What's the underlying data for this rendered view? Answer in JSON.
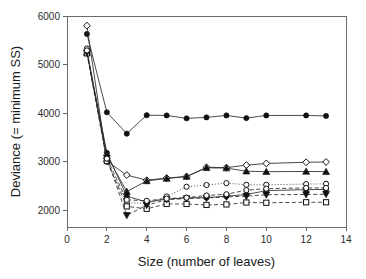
{
  "chart_data": {
    "type": "line",
    "title": "",
    "xlabel": "Size (number of leaves)",
    "ylabel": "Deviance (= minimum SS)",
    "xlim": [
      0,
      14
    ],
    "ylim": [
      1650,
      6000
    ],
    "xticks": [
      0,
      2,
      4,
      6,
      8,
      10,
      12,
      14
    ],
    "yticks": [
      2000,
      3000,
      4000,
      5000,
      6000
    ],
    "grid": false,
    "legend": "none",
    "series": [
      {
        "name": "series-1-filled-circle-upper",
        "marker": "filled-circle",
        "line": "solid",
        "x": [
          1,
          2,
          3,
          4,
          5,
          6,
          7,
          8,
          9,
          10,
          12,
          13
        ],
        "y": [
          5630,
          4015,
          3575,
          3955,
          3950,
          3890,
          3910,
          3950,
          3895,
          3950,
          3950,
          3940
        ]
      },
      {
        "name": "series-2-open-diamond",
        "marker": "open-diamond",
        "line": "solid",
        "x": [
          1,
          2,
          3,
          4,
          5,
          6,
          7,
          8,
          9,
          10,
          12,
          13
        ],
        "y": [
          5800,
          3005,
          2720,
          2615,
          2660,
          2690,
          2880,
          2875,
          2925,
          2960,
          2985,
          2990
        ]
      },
      {
        "name": "series-3-filled-triangle",
        "marker": "filled-triangle",
        "line": "solid",
        "x": [
          1,
          2,
          3,
          4,
          5,
          6,
          7,
          8,
          9,
          10,
          12,
          13
        ],
        "y": [
          5250,
          3120,
          2380,
          2600,
          2650,
          2690,
          2870,
          2865,
          2800,
          2790,
          2795,
          2790
        ]
      },
      {
        "name": "series-4-open-circle",
        "marker": "open-circle",
        "line": "dotted",
        "x": [
          1,
          2,
          3,
          4,
          5,
          6,
          7,
          8,
          9,
          10,
          12,
          13
        ],
        "y": [
          5330,
          3000,
          2150,
          2140,
          2280,
          2480,
          2515,
          2555,
          2520,
          2520,
          2535,
          2540
        ]
      },
      {
        "name": "series-5-filled-circle-lower",
        "marker": "filled-circle",
        "line": "solid",
        "x": [
          1,
          2,
          3,
          4,
          5,
          6,
          7,
          8,
          9,
          10,
          12,
          13
        ],
        "y": [
          5270,
          3180,
          2285,
          2165,
          2225,
          2250,
          2255,
          2285,
          2320,
          2400,
          2420,
          2425
        ]
      },
      {
        "name": "series-6-open-square",
        "marker": "open-square",
        "line": "dashed",
        "x": [
          1,
          2,
          3,
          4,
          5,
          6,
          7,
          8,
          9,
          10,
          12,
          13
        ],
        "y": [
          5230,
          3010,
          2075,
          2025,
          2125,
          2125,
          2105,
          2115,
          2155,
          2150,
          2160,
          2160
        ]
      },
      {
        "name": "series-7-filled-inverted-triangle",
        "marker": "filled-inverted-triangle",
        "line": "dashed",
        "x": [
          1,
          2,
          3,
          4,
          5,
          6,
          7,
          8,
          9,
          10,
          12,
          13
        ],
        "y": [
          5240,
          3075,
          1890,
          2100,
          2215,
          2235,
          2250,
          2270,
          2285,
          2315,
          2320,
          2325
        ]
      },
      {
        "name": "series-8-open-circle-lower",
        "marker": "open-circle",
        "line": "dashed",
        "x": [
          1,
          2,
          3,
          4,
          5,
          6,
          7,
          8,
          9,
          10,
          12,
          13
        ],
        "y": [
          5290,
          3060,
          2210,
          2190,
          2235,
          2255,
          2300,
          2325,
          2410,
          2440,
          2455,
          2455
        ]
      }
    ]
  },
  "axis": {
    "xlabel": "Size (number of leaves)",
    "ylabel": "Deviance (= minimum SS)",
    "xticks": [
      "0",
      "2",
      "4",
      "6",
      "8",
      "10",
      "12",
      "14"
    ],
    "yticks": [
      "2000",
      "3000",
      "4000",
      "5000",
      "6000"
    ]
  },
  "colors": {
    "line": "#2b2b2b",
    "frame": "#6b6b6b",
    "text": "#1a1a1a",
    "background": "#ffffff"
  }
}
